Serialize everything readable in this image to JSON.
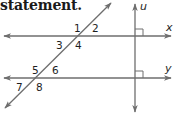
{
  "header": {
    "text": "statement."
  },
  "diagram": {
    "line_color": "#6e6e6e",
    "lines": {
      "x": {
        "label": "x"
      },
      "y": {
        "label": "y"
      },
      "u": {
        "label": "u"
      }
    },
    "angles": [
      {
        "id": "1",
        "label": "1"
      },
      {
        "id": "2",
        "label": "2"
      },
      {
        "id": "3",
        "label": "3"
      },
      {
        "id": "4",
        "label": "4"
      },
      {
        "id": "5",
        "label": "5"
      },
      {
        "id": "6",
        "label": "6"
      },
      {
        "id": "7",
        "label": "7"
      },
      {
        "id": "8",
        "label": "8"
      }
    ],
    "right_angle_marks": [
      "u-x",
      "u-y"
    ]
  }
}
